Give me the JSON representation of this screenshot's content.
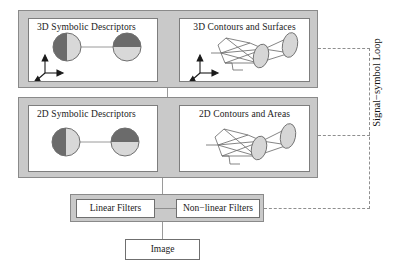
{
  "diagram": {
    "bands": [
      {
        "id": "3d",
        "panels": [
          {
            "id": "3d-symbolic",
            "title": "3D Symbolic Descriptors",
            "has_axes": true,
            "graphic": "two-shaded-circles-linked"
          },
          {
            "id": "3d-contours",
            "title": "3D Contours and Surfaces",
            "has_axes": true,
            "graphic": "wireframe-with-ellipses"
          }
        ]
      },
      {
        "id": "2d",
        "panels": [
          {
            "id": "2d-symbolic",
            "title": "2D Symbolic Descriptors",
            "has_axes": false,
            "graphic": "two-shaded-circles-linked"
          },
          {
            "id": "2d-contours",
            "title": "2D Contours and Areas",
            "has_axes": false,
            "graphic": "wireframe-with-ellipses"
          }
        ]
      }
    ],
    "filters": {
      "linear_label": "Linear Filters",
      "nonlinear_label": "Non−linear Filters"
    },
    "image_label": "Image",
    "loop_label": "Signal−symbol Loop",
    "colors": {
      "band_fill": "#c9c9c9",
      "band_border": "#8a8a8a",
      "panel_fill": "#ffffff",
      "panel_border": "#7d7d7d",
      "circle_dark": "#6b6b6b",
      "circle_light": "#d8d8d8",
      "ellipse_fill": "#d6d6d6",
      "line": "#8f8f8f",
      "text": "#1a1a1a"
    }
  }
}
